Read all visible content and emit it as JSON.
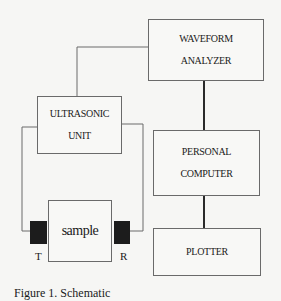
{
  "diagram": {
    "nodes": {
      "waveform_analyzer": {
        "line1": "WAVEFORM",
        "line2": "ANALYZER"
      },
      "ultrasonic_unit": {
        "line1": "ULTRASONIC",
        "line2": "UNIT"
      },
      "personal_computer": {
        "line1": "PERSONAL",
        "line2": "COMPUTER"
      },
      "plotter": {
        "line1": "PLOTTER"
      },
      "sample": {
        "line1": "sample"
      }
    },
    "transducers": {
      "transmitter": {
        "label": "T"
      },
      "receiver": {
        "label": "R"
      }
    },
    "edges": [
      {
        "from": "ultrasonic_unit",
        "to": "waveform_analyzer",
        "style": "thin"
      },
      {
        "from": "waveform_analyzer",
        "to": "personal_computer",
        "style": "thick"
      },
      {
        "from": "personal_computer",
        "to": "plotter",
        "style": "thick"
      },
      {
        "from": "ultrasonic_unit",
        "to": "transmitter",
        "style": "thin"
      },
      {
        "from": "ultrasonic_unit",
        "to": "receiver",
        "style": "thin"
      }
    ],
    "caption": "Figure 1. Schematic"
  }
}
